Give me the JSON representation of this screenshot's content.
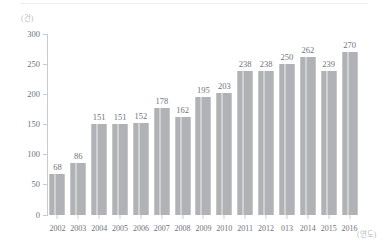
{
  "chart_data": {
    "type": "bar",
    "title": "",
    "subtitle": "",
    "xlabel": "(연도)",
    "ylabel": "(건)",
    "categories": [
      "2002",
      "2003",
      "2004",
      "2005",
      "2006",
      "2007",
      "2008",
      "2009",
      "2010",
      "2011",
      "2012",
      "013",
      "2014",
      "2015",
      "2016"
    ],
    "values": [
      68,
      86,
      151,
      151,
      152,
      178,
      162,
      195,
      203,
      238,
      238,
      250,
      262,
      239,
      270
    ],
    "ylim": [
      0,
      300
    ],
    "ytick_labels": [
      "0",
      "50",
      "100",
      "150",
      "200",
      "250",
      "300"
    ],
    "ytick_values": [
      0,
      50,
      100,
      150,
      200,
      250,
      300
    ],
    "grid": false,
    "legend": "none",
    "bar_color": "#b3b5b8",
    "axis_color": "#c8cbd0",
    "text_color": "#6f737a",
    "unit_color": "#b9bcc2"
  }
}
